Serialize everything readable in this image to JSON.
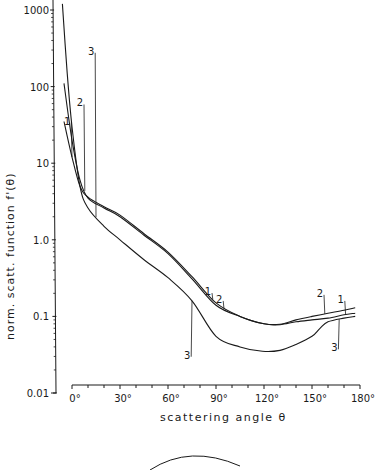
{
  "chart_data": {
    "type": "line",
    "title": "",
    "xlabel": "scattering angle θ",
    "ylabel": "norm. scatt. function f'(θ)",
    "xscale": "linear",
    "yscale": "log",
    "xlim": [
      0,
      180
    ],
    "ylim": [
      0.01,
      1000
    ],
    "grid": false,
    "legend": "inline curve labels",
    "x_ticks": [
      "0°",
      "30°",
      "60°",
      "90°",
      "120°",
      "150°",
      "180°"
    ],
    "y_ticks": [
      "1000",
      "100",
      "10",
      "1.0",
      "0.1",
      "0.01"
    ],
    "series": [
      {
        "name": "1",
        "x": [
          -5,
          0,
          5,
          10,
          20,
          30,
          45,
          60,
          75,
          90,
          105,
          120,
          130,
          140,
          150,
          160,
          170,
          177
        ],
        "y": [
          35,
          12,
          5.0,
          3.6,
          2.7,
          2.1,
          1.2,
          0.69,
          0.33,
          0.15,
          0.1,
          0.08,
          0.078,
          0.085,
          0.09,
          0.095,
          0.105,
          0.11
        ]
      },
      {
        "name": "2",
        "x": [
          -5,
          0,
          5,
          10,
          20,
          30,
          45,
          60,
          75,
          90,
          105,
          120,
          130,
          140,
          150,
          160,
          170,
          177
        ],
        "y": [
          110,
          20,
          6.0,
          3.5,
          2.6,
          2.0,
          1.15,
          0.66,
          0.31,
          0.14,
          0.1,
          0.08,
          0.079,
          0.09,
          0.1,
          0.11,
          0.12,
          0.13
        ]
      },
      {
        "name": "3",
        "x": [
          -6,
          -3,
          0,
          5,
          10,
          20,
          30,
          45,
          60,
          75,
          90,
          105,
          119,
          130,
          140,
          150,
          155,
          160,
          170,
          177
        ],
        "y": [
          1200,
          150,
          30,
          5.0,
          2.6,
          1.5,
          1.0,
          0.55,
          0.32,
          0.16,
          0.055,
          0.04,
          0.035,
          0.036,
          0.043,
          0.055,
          0.07,
          0.085,
          0.095,
          0.1
        ]
      }
    ],
    "curve_labels": [
      {
        "text": "1",
        "series": "1",
        "at": [
          -3,
          32
        ]
      },
      {
        "text": "1",
        "series": "1",
        "at": [
          85,
          0.19
        ]
      },
      {
        "text": "1",
        "series": "1",
        "at": [
          168,
          0.15
        ]
      },
      {
        "text": "2",
        "series": "2",
        "at": [
          5,
          55
        ]
      },
      {
        "text": "2",
        "series": "2",
        "at": [
          92,
          0.15
        ]
      },
      {
        "text": "2",
        "series": "2",
        "at": [
          155,
          0.18
        ]
      },
      {
        "text": "3",
        "series": "3",
        "at": [
          12,
          260
        ]
      },
      {
        "text": "3",
        "series": "3",
        "at": [
          72,
          0.028
        ]
      },
      {
        "text": "3",
        "series": "3",
        "at": [
          164,
          0.035
        ]
      }
    ]
  }
}
